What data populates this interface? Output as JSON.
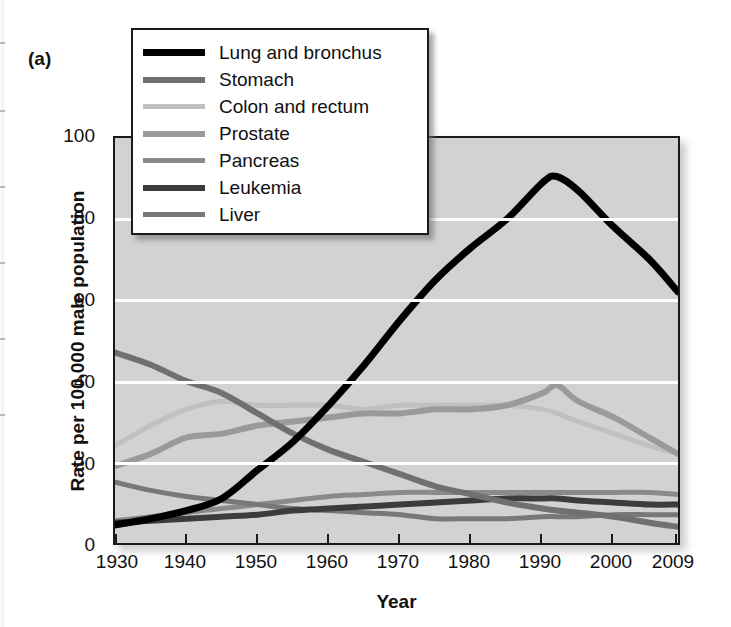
{
  "panel": {
    "label": "(a)"
  },
  "axes": {
    "y_title": "Rate per 100,000 male population",
    "x_title": "Year",
    "y_ticks": [
      "0",
      "20",
      "40",
      "60",
      "80",
      "100"
    ],
    "x_ticks": [
      "1930",
      "1940",
      "1950",
      "1960",
      "1970",
      "1980",
      "1990",
      "2000",
      "2009"
    ]
  },
  "colors": {
    "plot_background": "#d2d2d2",
    "gridline": "#ffffff",
    "axis": "#1a1a1a",
    "legend_background": "#ffffff",
    "lung_and_bronchus": "#000000",
    "stomach": "#707070",
    "colon_and_rectum": "#c0c0c0",
    "prostate": "#9a9a9a",
    "pancreas": "#8a8a8a",
    "leukemia": "#3c3c3c",
    "liver": "#787878"
  },
  "legend": {
    "items": [
      {
        "label": "Lung and bronchus",
        "color": "#000000",
        "width": 7
      },
      {
        "label": "Stomach",
        "color": "#707070",
        "width": 6
      },
      {
        "label": "Colon and rectum",
        "color": "#c0c0c0",
        "width": 5
      },
      {
        "label": "Prostate",
        "color": "#9a9a9a",
        "width": 6
      },
      {
        "label": "Pancreas",
        "color": "#8a8a8a",
        "width": 5
      },
      {
        "label": "Leukemia",
        "color": "#3c3c3c",
        "width": 6
      },
      {
        "label": "Liver",
        "color": "#787878",
        "width": 5
      }
    ]
  },
  "chart_data": {
    "type": "line",
    "title": "",
    "xlabel": "Year",
    "ylabel": "Rate per 100,000 male population",
    "xlim": [
      1930,
      2009
    ],
    "ylim": [
      0,
      100
    ],
    "grid": true,
    "legend_position": "upper-left",
    "x": [
      1930,
      1935,
      1940,
      1945,
      1950,
      1955,
      1960,
      1965,
      1970,
      1975,
      1980,
      1985,
      1990,
      1992,
      1995,
      2000,
      2005,
      2009
    ],
    "series": [
      {
        "name": "Lung and bronchus",
        "color": "#000000",
        "values": [
          4.5,
          6,
          8,
          11,
          18,
          25,
          34,
          44,
          55,
          65,
          73,
          80,
          89,
          90.5,
          87,
          78,
          70,
          62
        ]
      },
      {
        "name": "Stomach",
        "color": "#707070",
        "values": [
          47,
          44,
          40,
          37,
          32,
          27,
          23,
          20,
          17,
          14,
          12,
          10,
          8.5,
          8,
          7.5,
          6.5,
          5,
          4
        ]
      },
      {
        "name": "Colon and rectum",
        "color": "#c0c0c0",
        "values": [
          24,
          29,
          33,
          35,
          34,
          34,
          34,
          33,
          34,
          34,
          34,
          34,
          33,
          32,
          30,
          27,
          24,
          22
        ]
      },
      {
        "name": "Prostate",
        "color": "#9a9a9a",
        "values": [
          19,
          22,
          26,
          27,
          29,
          30,
          31,
          32,
          32,
          33,
          33,
          34,
          37,
          39,
          35,
          31,
          26,
          22
        ]
      },
      {
        "name": "Pancreas",
        "color": "#8a8a8a",
        "values": [
          5.5,
          6.5,
          7.5,
          8.5,
          9.5,
          10.5,
          11.5,
          12,
          12.5,
          12.5,
          12.5,
          12.5,
          12.5,
          12.5,
          12.5,
          12.5,
          12.5,
          12
        ]
      },
      {
        "name": "Leukemia",
        "color": "#3c3c3c",
        "values": [
          5,
          5.5,
          6,
          6.5,
          7,
          8,
          8.5,
          9,
          9.5,
          10,
          10.5,
          11,
          11,
          11,
          10.5,
          10,
          9.5,
          9.5
        ]
      },
      {
        "name": "Liver",
        "color": "#787878",
        "values": [
          15,
          13,
          11.5,
          10.5,
          9.5,
          8.5,
          8,
          7.5,
          7,
          6,
          6,
          6,
          6.5,
          6.5,
          6.5,
          7,
          7,
          7
        ]
      }
    ]
  }
}
